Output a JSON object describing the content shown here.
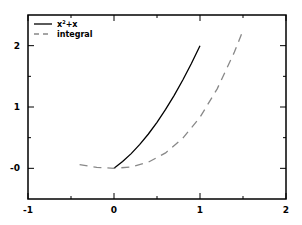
{
  "chart_data": {
    "type": "line",
    "title": "",
    "xlabel": "",
    "ylabel": "",
    "xlim": [
      -1,
      2
    ],
    "ylim": [
      -0.5,
      2.5
    ],
    "x_ticks": [
      "-1",
      "0",
      "1",
      "2"
    ],
    "y_ticks": [
      "-0",
      "1",
      "2"
    ],
    "grid": false,
    "legend_position": "upper left",
    "series": [
      {
        "name": "x²+x",
        "style": "solid",
        "color": "#000000",
        "x": [
          0,
          0.1,
          0.2,
          0.3,
          0.4,
          0.5,
          0.6,
          0.7,
          0.8,
          0.9,
          1.0
        ],
        "y": [
          0,
          0.11,
          0.24,
          0.39,
          0.56,
          0.75,
          0.96,
          1.19,
          1.44,
          1.71,
          2.0
        ]
      },
      {
        "name": "integral",
        "style": "dashed",
        "color": "#888888",
        "x": [
          -0.4,
          -0.2,
          0,
          0.2,
          0.4,
          0.6,
          0.8,
          1.0,
          1.2,
          1.4,
          1.5
        ],
        "y": [
          0.059,
          0.017,
          0,
          0.023,
          0.101,
          0.252,
          0.491,
          0.833,
          1.296,
          1.895,
          2.25
        ]
      }
    ]
  },
  "legend": {
    "item1_prefix": "x",
    "item1_sup": "2",
    "item1_suffix": "+x",
    "item2": "integral"
  }
}
